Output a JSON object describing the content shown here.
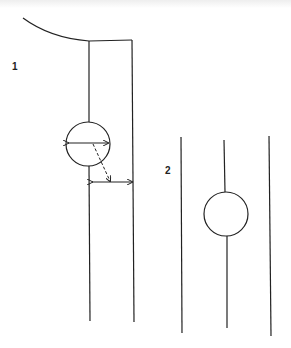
{
  "diagram": {
    "panel1": {
      "label": "1",
      "description": "Vessel wall with curved top, circle measured by diameter arrow and distance arrow to wall"
    },
    "panel2": {
      "label": "2",
      "description": "Three vertical lines with a circle centered on the middle line"
    },
    "colors": {
      "stroke": "#222222",
      "background": "#ffffff"
    }
  }
}
